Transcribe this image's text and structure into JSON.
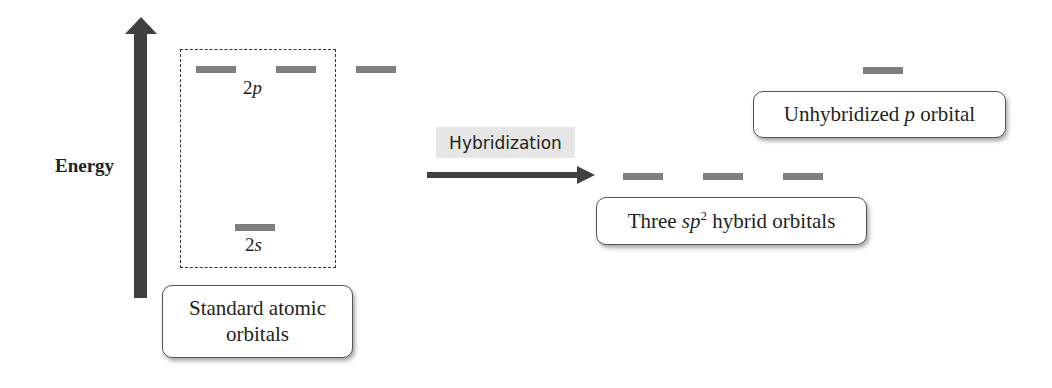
{
  "axis": {
    "label": "Energy",
    "direction": "up"
  },
  "standard": {
    "p_label_num": "2",
    "p_label_letter": "p",
    "s_label_num": "2",
    "s_label_letter": "s",
    "callout_line1": "Standard atomic",
    "callout_line2": "orbitals",
    "p_orbital_count": 3,
    "s_orbital_count": 1
  },
  "process": {
    "label": "Hybridization"
  },
  "hybrid": {
    "callout_prefix": "Three ",
    "callout_italic": "sp",
    "callout_sup": "2",
    "callout_suffix": " hybrid orbitals",
    "orbital_count": 3
  },
  "unhybridized": {
    "callout_prefix": "Unhybridized ",
    "callout_italic": "p",
    "callout_suffix": " orbital",
    "orbital_count": 1
  },
  "colors": {
    "orbital_bar": "#7f7f7f",
    "arrow": "#404040",
    "label_bg": "#e6e6e6"
  }
}
